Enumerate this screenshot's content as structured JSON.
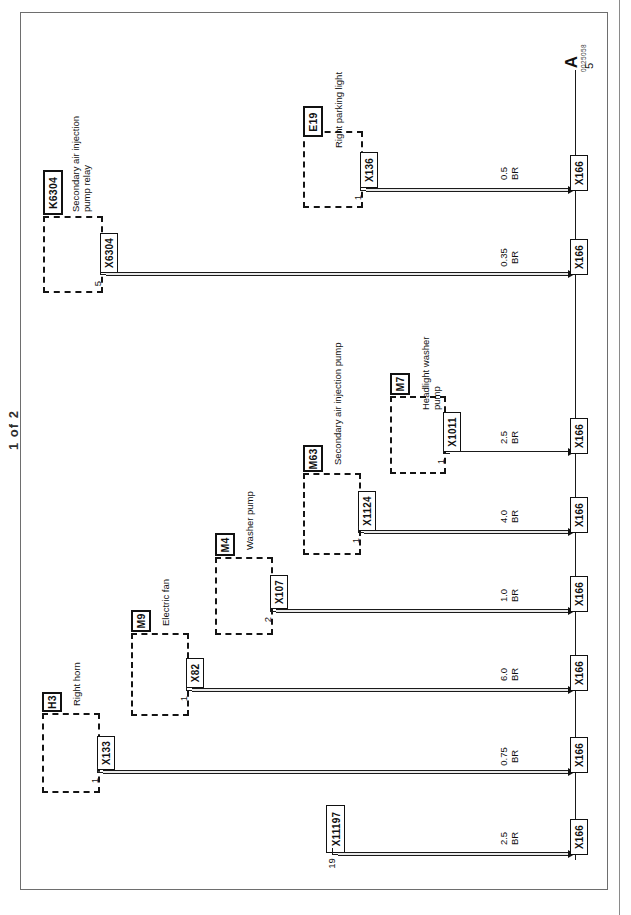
{
  "sheet": {
    "page_label": "1 of 2",
    "continuation_marker": "A",
    "continuation_tick": "5",
    "drawing_number": "0025058"
  },
  "ground_bus": {
    "terminal_label": "X166"
  },
  "circuits": [
    {
      "id": "e19-right-parking-light",
      "component_id": "E19",
      "component_name": "Right parking light",
      "connector": "X136",
      "pin": "1",
      "wire_size": "0.5",
      "wire_color": "BR",
      "ground_terminal": "X166"
    },
    {
      "id": "k6304-secondary-air-pump-relay",
      "component_id": "K6304",
      "component_name": "Secondary air injection\npump relay",
      "connector": "X6304",
      "pin": "5",
      "wire_size": "0.35",
      "wire_color": "BR",
      "ground_terminal": "X166"
    },
    {
      "id": "m7-headlight-washer-pump",
      "component_id": "M7",
      "component_name": "Headlight washer\npump",
      "connector": "X1011",
      "pin": "1",
      "wire_size": "2.5",
      "wire_color": "BR",
      "ground_terminal": "X166"
    },
    {
      "id": "m63-secondary-air-injection-pump",
      "component_id": "M63",
      "component_name": "Secondary air injection pump",
      "connector": "X1124",
      "pin": "1",
      "wire_size": "4.0",
      "wire_color": "BR",
      "ground_terminal": "X166"
    },
    {
      "id": "m4-washer-pump",
      "component_id": "M4",
      "component_name": "Washer pump",
      "connector": "X107",
      "pin": "2",
      "wire_size": "1.0",
      "wire_color": "BR",
      "ground_terminal": "X166"
    },
    {
      "id": "m9-electric-fan",
      "component_id": "M9",
      "component_name": "Electric fan",
      "connector": "X82",
      "pin": "1",
      "wire_size": "6.0",
      "wire_color": "BR",
      "ground_terminal": "X166"
    },
    {
      "id": "h3-right-horn",
      "component_id": "H3",
      "component_name": "Right horn",
      "connector": "X133",
      "pin": "1",
      "wire_size": "0.75",
      "wire_color": "BR",
      "ground_terminal": "X166"
    },
    {
      "id": "x11197-connector-only",
      "component_id": "",
      "component_name": "",
      "connector": "X11197",
      "pin": "19",
      "wire_size": "2.5",
      "wire_color": "BR",
      "ground_terminal": "X166"
    }
  ]
}
